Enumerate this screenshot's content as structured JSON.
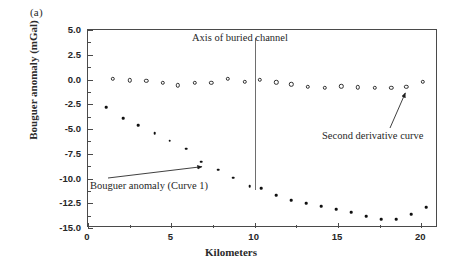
{
  "figure": {
    "panel_label": "(a)"
  },
  "chart_data": {
    "type": "scatter",
    "title": "",
    "xlabel": "Kilometers",
    "ylabel": "Bouguer anomaly (mGal)",
    "xlim": [
      0,
      21
    ],
    "ylim": [
      -15.0,
      5.0
    ],
    "grid": false,
    "legend": "none (inline annotations)",
    "xticks": [
      0,
      5,
      10,
      15,
      20
    ],
    "xticklabels": [
      "0",
      "5",
      "10",
      "15",
      "20"
    ],
    "x_minor_ticks": [
      2.5,
      7.5,
      12.5,
      17.5
    ],
    "yticks": [
      5.0,
      2.5,
      0.0,
      -2.5,
      -5.0,
      -7.5,
      -10.0,
      -12.5,
      -15.0
    ],
    "yticklabels": [
      "5.0",
      "2.5",
      "0.0",
      "-2.5",
      "-5.0",
      "-7.5",
      "-10.0",
      "-12.5",
      "-15.0"
    ],
    "y_minor_ticks": [
      3.75,
      1.25,
      -1.25,
      -3.75,
      -6.25,
      -8.75,
      -11.25,
      -13.75
    ],
    "series": [
      {
        "name": "Second derivative curve",
        "marker": "open-circle",
        "x": [
          1.5,
          2.5,
          3.5,
          4.5,
          5.4,
          6.4,
          7.4,
          8.4,
          9.4,
          10.3,
          11.3,
          12.2,
          13.2,
          14.2,
          15.2,
          16.2,
          17.2,
          18.2,
          19.1,
          20.1
        ],
        "y": [
          0.05,
          -0.1,
          -0.15,
          -0.35,
          -0.6,
          -0.35,
          -0.35,
          0.05,
          -0.25,
          -0.05,
          -0.3,
          -0.5,
          -0.75,
          -0.85,
          -0.7,
          -0.8,
          -0.85,
          -0.85,
          -0.75,
          -0.25
        ]
      },
      {
        "name": "Bouguer anomaly (Curve 1)",
        "marker": "filled-dot",
        "x": [
          1.1,
          2.1,
          3.0,
          4.0,
          4.9,
          5.9,
          6.8,
          7.8,
          8.7,
          9.7,
          10.4,
          11.3,
          12.2,
          13.1,
          14.0,
          14.9,
          15.8,
          16.7,
          17.6,
          18.5,
          19.4,
          20.3
        ],
        "y": [
          -2.8,
          -3.9,
          -4.6,
          -5.4,
          -6.2,
          -7.0,
          -8.3,
          -9.1,
          -9.9,
          -10.8,
          -11.0,
          -11.7,
          -12.2,
          -12.5,
          -12.8,
          -13.1,
          -13.4,
          -13.8,
          -14.1,
          -14.1,
          -13.6,
          -12.9
        ]
      }
    ],
    "annotations": [
      {
        "name": "axis-of-buried-channel",
        "text": "Axis of buried channel",
        "marker_type": "vertical-line",
        "x": 10.0,
        "y_top": 4.2,
        "y_bottom": -11.2
      },
      {
        "name": "bouguer-anomaly-label",
        "text": "Bouguer anomaly (Curve 1)",
        "marker_type": "arrow",
        "points_to_x": 6.9,
        "points_to_y": -8.3
      },
      {
        "name": "second-derivative-label",
        "text": "Second derivative curve",
        "marker_type": "arrow",
        "points_to_x": 19.1,
        "points_to_y": -0.75
      }
    ]
  },
  "colors": {
    "axis": "#4a4a4a",
    "marker_open": "#2e2e2e",
    "marker_filled": "#101010",
    "channel_line": "#6e6e6e",
    "text": "#1f1f1f",
    "background": "#ffffff"
  }
}
